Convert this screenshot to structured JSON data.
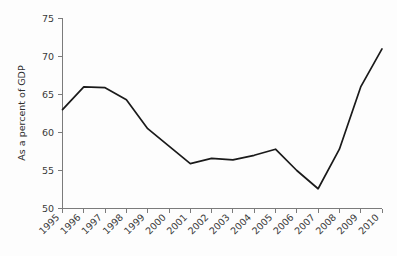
{
  "chart_data": {
    "type": "line",
    "title": "",
    "subtitle": "",
    "xlabel": "",
    "ylabel": "As a percent of GDP",
    "categories": [
      "1995",
      "1996",
      "1997",
      "1998",
      "1999",
      "2000",
      "2001",
      "2002",
      "2003",
      "2004",
      "2005",
      "2006",
      "2007",
      "2008",
      "2009",
      "2010"
    ],
    "x": [
      1995,
      1996,
      1997,
      1998,
      1999,
      2000,
      2001,
      2002,
      2003,
      2004,
      2005,
      2006,
      2007,
      2008,
      2009,
      2010
    ],
    "values": [
      63.0,
      66.0,
      65.9,
      64.3,
      60.5,
      58.2,
      55.9,
      56.6,
      56.4,
      57.0,
      57.8,
      55.0,
      52.6,
      57.8,
      66.0,
      71.0
    ],
    "series": [
      {
        "name": "As a percent of GDP",
        "values": [
          63.0,
          66.0,
          65.9,
          64.3,
          60.5,
          58.2,
          55.9,
          56.6,
          56.4,
          57.0,
          57.8,
          55.0,
          52.6,
          57.8,
          66.0,
          71.0
        ]
      }
    ],
    "yticks": [
      50,
      55,
      60,
      65,
      70,
      75
    ],
    "ytick_labels": [
      "50",
      "55",
      "60",
      "65",
      "70",
      "75"
    ],
    "ylim": [
      50,
      75
    ],
    "xlim": [
      1995,
      2010
    ],
    "grid": false,
    "legend": false,
    "legend_position": "none",
    "line_color": "#1a1a1a",
    "axis_color": "#7b7b7b",
    "background_color": "#fdfdfd",
    "xtick_rotation": 45,
    "annotations": []
  }
}
